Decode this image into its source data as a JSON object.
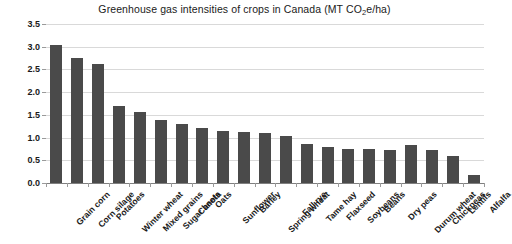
{
  "chart_data": {
    "type": "bar",
    "title": "Greenhouse gas intensities of crops in Canada (MT CO2e/ha)",
    "title_prefix": "Greenhouse gas intensities of crops in Canada (MT CO",
    "title_sub": "2",
    "title_suffix": "e/ha)",
    "xlabel": "",
    "ylabel": "",
    "ylim": [
      0,
      3.5
    ],
    "ytick_values": [
      0.0,
      0.5,
      1.0,
      1.5,
      2.0,
      2.5,
      3.0,
      3.5
    ],
    "ytick_labels": [
      "0.0",
      "0.5",
      "1.0",
      "1.5",
      "2.0",
      "2.5",
      "3.0",
      "3.5"
    ],
    "grid": true,
    "legend": false,
    "bar_color": "#4a4a4a",
    "gridline_color": "#d9d9d9",
    "axis_color": "#808080",
    "categories": [
      "Grain corn",
      "Corn silage",
      "Potatoes",
      "Winter wheat",
      "Mixed grains",
      "Sugar beets",
      "Canola",
      "Oats",
      "Sunflower",
      "Barley",
      "Spring wheat",
      "Fall rye",
      "Tame hay",
      "Flaxseed",
      "Soybeans",
      "Beans",
      "Dry peas",
      "Durum wheat",
      "Chickpeas",
      "Lentils",
      "Alfalfa"
    ],
    "values": [
      3.03,
      2.75,
      2.62,
      1.7,
      1.57,
      1.38,
      1.3,
      1.22,
      1.15,
      1.12,
      1.1,
      1.04,
      0.85,
      0.8,
      0.74,
      0.74,
      0.73,
      0.84,
      0.72,
      0.6,
      0.18
    ]
  }
}
